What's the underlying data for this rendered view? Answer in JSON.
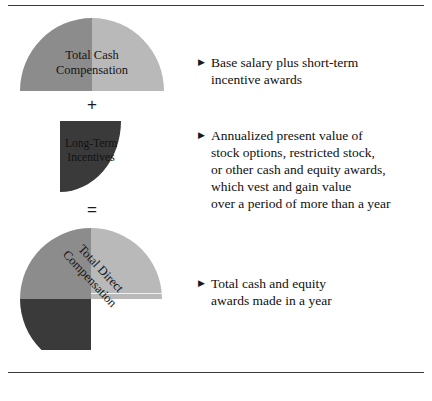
{
  "figure": {
    "rules": {
      "top_label": "top-divider",
      "bottom_label": "bottom-divider"
    },
    "shapes": [
      {
        "id": "total-cash-compensation",
        "type": "half-circle",
        "label": "Total Cash\nCompensation",
        "segments": [
          {
            "name": "left-half",
            "color": "#8c8c8c"
          },
          {
            "name": "right-half",
            "color": "#b9b9b9"
          }
        ]
      },
      {
        "id": "long-term-incentives",
        "type": "quarter-circle",
        "label": "Long-Term\nIncentives",
        "segments": [
          {
            "name": "quadrant",
            "color": "#3a3a3a"
          }
        ]
      },
      {
        "id": "total-direct-compensation",
        "type": "three-quarter-circle",
        "label": "Total Direct\nCompensation",
        "segments": [
          {
            "name": "top-left",
            "color": "#8c8c8c"
          },
          {
            "name": "top-right",
            "color": "#b9b9b9"
          },
          {
            "name": "bottom-left",
            "color": "#3a3a3a"
          }
        ]
      }
    ],
    "operators": {
      "plus": "+",
      "equals": "="
    },
    "bullets": [
      {
        "marker": "▶",
        "text": "Base salary plus short-term\nincentive awards"
      },
      {
        "marker": "▶",
        "text": "Annualized present value of\nstock options, restricted stock,\nor other cash and equity awards,\nwhich vest and gain value\nover a period of more than a year"
      },
      {
        "marker": "▶",
        "text": "Total cash and equity\nawards made in a year"
      }
    ],
    "colors": {
      "mid_gray": "#8c8c8c",
      "light_gray": "#b9b9b9",
      "dark_gray": "#3a3a3a",
      "rule": "#3a3a3a",
      "text": "#0f0f0f",
      "background": "#ffffff"
    }
  }
}
